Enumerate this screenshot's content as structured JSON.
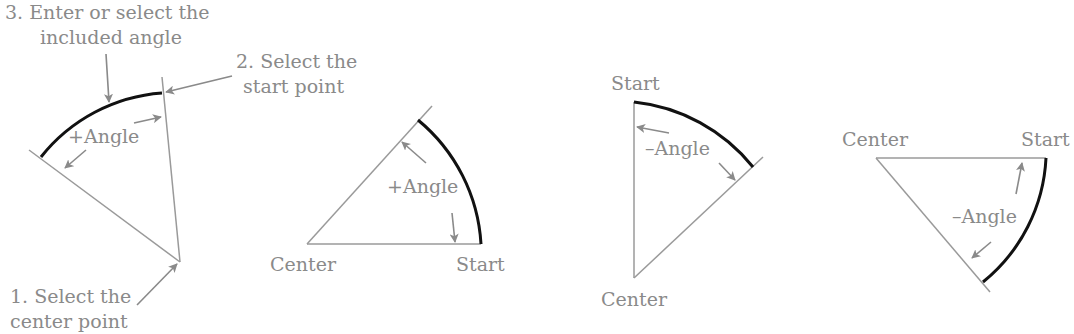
{
  "diagram": {
    "type": "arc-start-center-angle-illustration",
    "colors": {
      "geometry": "#9a9a9a",
      "arc": "#111111",
      "text": "#8a8a8a",
      "background": "#ffffff"
    },
    "panel1": {
      "step3_line1": "3. Enter or select the",
      "step3_line2": "included angle",
      "step2_line1": "2. Select the",
      "step2_line2": "start point",
      "step1_line1": "1. Select the",
      "step1_line2": "center point",
      "angle_label": "+Angle"
    },
    "panel2": {
      "center_label": "Center",
      "start_label": "Start",
      "angle_label": "+Angle"
    },
    "panel3": {
      "start_label": "Start",
      "center_label": "Center",
      "angle_label": "–Angle"
    },
    "panel4": {
      "center_label": "Center",
      "start_label": "Start",
      "angle_label": "–Angle"
    }
  }
}
